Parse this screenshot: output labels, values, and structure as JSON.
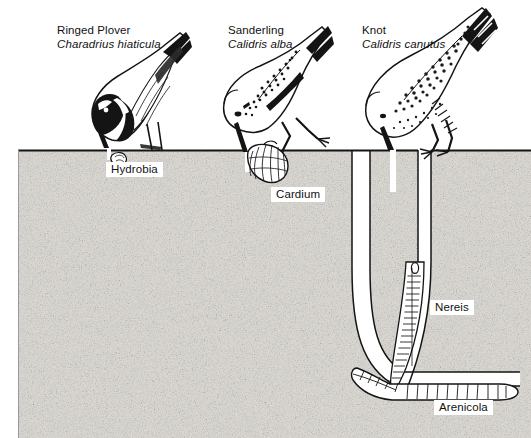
{
  "figure": {
    "kind": "scientific-illustration",
    "habitat_label": "sand / mud substrate",
    "surface_level_px": 150
  },
  "birds": [
    {
      "id": "ringed-plover",
      "common_name": "Ringed Plover",
      "scientific_name": "Charadrius hiaticula",
      "label_x": 57,
      "label_y": 24,
      "prey": "Hydrobia",
      "feeding_depth": "surface",
      "bill": "short"
    },
    {
      "id": "sanderling",
      "common_name": "Sanderling",
      "scientific_name": "Calidris alba",
      "label_x": 228,
      "label_y": 24,
      "prey": "Cardium",
      "feeding_depth": "shallow",
      "bill": "medium"
    },
    {
      "id": "knot",
      "common_name": "Knot",
      "scientific_name": "Calidris canutus",
      "label_x": 362,
      "label_y": 24,
      "prey": "Nereis",
      "feeding_depth": "deep",
      "bill": "long"
    }
  ],
  "prey_labels": [
    {
      "id": "hydrobia",
      "text": "Hydrobia",
      "x": 106,
      "y": 162,
      "kind": "mud-snail"
    },
    {
      "id": "cardium",
      "text": "Cardium",
      "x": 271,
      "y": 187,
      "kind": "cockle"
    },
    {
      "id": "nereis",
      "text": "Nereis",
      "x": 430,
      "y": 300,
      "kind": "ragworm"
    },
    {
      "id": "arenicola",
      "text": "Arenicola",
      "x": 434,
      "y": 400,
      "kind": "lugworm"
    }
  ],
  "colors": {
    "ink": "#111111",
    "sand_base": "#f2f0ec",
    "sand_speckle": "#5a5a5a",
    "paper": "#ffffff",
    "burrow_fill": "#ffffff"
  }
}
